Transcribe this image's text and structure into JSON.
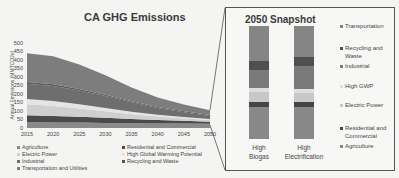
{
  "main_chart": {
    "title": "CA GHG Emissions",
    "ylabel": "Annual Emissions (MMTCO2e)",
    "yticks": [
      "500",
      "450",
      "400",
      "350",
      "300",
      "250",
      "200",
      "150",
      "100",
      "50",
      "0"
    ],
    "xticks": [
      "2015",
      "2020",
      "2025",
      "2030",
      "2035",
      "2040",
      "2045",
      "2050"
    ],
    "legend": [
      {
        "label": "Agriculture",
        "color": "#8a8a8a"
      },
      {
        "label": "Electric Power",
        "color": "#d0d0d0"
      },
      {
        "label": "Industrial",
        "color": "#6e6e6e"
      },
      {
        "label": "Transportation and Utilities",
        "color": "#7d7d7d"
      },
      {
        "label": "Residential and Commercial",
        "color": "#4a4a4a"
      },
      {
        "label": "High Global Warming Potential",
        "color": "#e2e2e2"
      },
      {
        "label": "Recycling and Waste",
        "color": "#555555"
      }
    ]
  },
  "snapshot": {
    "title": "2050 Snapshot",
    "bars": [
      {
        "label_line1": "High",
        "label_line2": "Biogas"
      },
      {
        "label_line1": "High",
        "label_line2": "Electrification"
      }
    ],
    "legend": [
      {
        "label": "Transportation",
        "color": "#858585"
      },
      {
        "label": "Recycling and Waste",
        "color": "#4f4f4f"
      },
      {
        "label": "Industrial",
        "color": "#7a7a7a"
      },
      {
        "label": "High GWP",
        "color": "#dedede"
      },
      {
        "label": "Electric Power",
        "color": "#c8c8c8"
      },
      {
        "label": "Residential and Commercial",
        "color": "#454545"
      },
      {
        "label": "Agriculture",
        "color": "#888888"
      }
    ]
  },
  "chart_data": [
    {
      "type": "area",
      "title": "CA GHG Emissions",
      "xlabel": "",
      "ylabel": "Annual Emissions (MMTCO2e)",
      "ylim": [
        0,
        500
      ],
      "x": [
        2015,
        2020,
        2025,
        2030,
        2035,
        2040,
        2045,
        2050
      ],
      "stacked": true,
      "series": [
        {
          "name": "Agriculture",
          "values": [
            35,
            33,
            32,
            30,
            28,
            27,
            26,
            25
          ]
        },
        {
          "name": "Residential and Commercial",
          "values": [
            40,
            38,
            34,
            30,
            25,
            20,
            16,
            12
          ]
        },
        {
          "name": "Electric Power",
          "values": [
            65,
            58,
            48,
            38,
            28,
            20,
            14,
            10
          ]
        },
        {
          "name": "High Global Warming Potential",
          "values": [
            30,
            30,
            26,
            20,
            15,
            11,
            8,
            6
          ]
        },
        {
          "name": "Industrial",
          "values": [
            90,
            88,
            80,
            70,
            55,
            40,
            28,
            18
          ]
        },
        {
          "name": "Recycling and Waste",
          "values": [
            10,
            10,
            9,
            8,
            7,
            6,
            6,
            5
          ]
        },
        {
          "name": "Transportation and Utilities",
          "values": [
            170,
            165,
            145,
            115,
            80,
            55,
            40,
            29
          ]
        }
      ],
      "legend_position": "bottom",
      "grid": false
    },
    {
      "type": "bar",
      "title": "2050 Snapshot",
      "categories": [
        "High Biogas",
        "High Electrification"
      ],
      "stacked": true,
      "series": [
        {
          "name": "Agriculture",
          "values": [
            36,
            36
          ]
        },
        {
          "name": "Residential and Commercial",
          "values": [
            6,
            5
          ]
        },
        {
          "name": "Electric Power",
          "values": [
            11,
            10
          ]
        },
        {
          "name": "High GWP",
          "values": [
            5,
            5
          ]
        },
        {
          "name": "Industrial",
          "values": [
            20,
            25
          ]
        },
        {
          "name": "Recycling and Waste",
          "values": [
            10,
            10
          ]
        },
        {
          "name": "Transportation",
          "values": [
            40,
            35
          ]
        }
      ],
      "legend_position": "right"
    }
  ]
}
